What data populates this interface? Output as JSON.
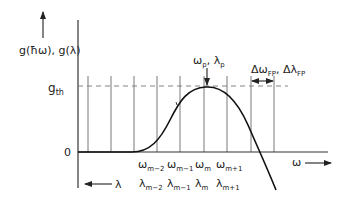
{
  "diagram": {
    "y_axis_label": "g(ħω), g(λ)",
    "threshold_label": "g",
    "threshold_sub": "th",
    "zero_label": "0",
    "peak_label": {
      "omega": "ω",
      "omega_sub": "p",
      "sep": ", ",
      "lambda": "λ",
      "lambda_sub": "p"
    },
    "fp_label": {
      "d1": "Δω",
      "d1_sub": "FP",
      "sep": ", ",
      "d2": "Δλ",
      "d2_sub": "FP"
    },
    "x_axis_label": "ω",
    "lambda_axis_label": "λ",
    "omega_ticks": [
      {
        "main": "ω",
        "sub": "m−2"
      },
      {
        "main": "ω",
        "sub": "m−1"
      },
      {
        "main": "ω",
        "sub": "m"
      },
      {
        "main": "ω",
        "sub": "m+1"
      }
    ],
    "lambda_ticks": [
      {
        "main": "λ",
        "sub": "m−2"
      },
      {
        "main": "λ",
        "sub": "m−1"
      },
      {
        "main": "λ",
        "sub": "m"
      },
      {
        "main": "λ",
        "sub": "m+1"
      }
    ],
    "colors": {
      "line": "#111111",
      "grid": "#555555",
      "dash": "#777777"
    }
  }
}
